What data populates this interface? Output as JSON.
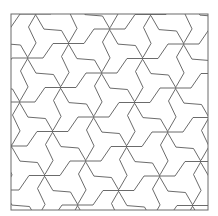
{
  "figure": {
    "type": "tripod-tiling",
    "stroke_color": "#5a5a5a",
    "frame_color": "#6a6a6a",
    "background": "#ffffff",
    "frame": {
      "x": 11,
      "y": 14,
      "width": 197,
      "height": 196
    },
    "lattice": {
      "origin": [
        28,
        58
      ],
      "vector_a": [
        41,
        -14.5
      ],
      "vector_b": [
        33,
        29.5
      ]
    },
    "edge_shape": [
      [
        0,
        0
      ],
      [
        15,
        0
      ],
      [
        25,
        -14.5
      ],
      [
        41,
        -14.5
      ]
    ],
    "rotations_deg": [
      0,
      120,
      240
    ]
  }
}
